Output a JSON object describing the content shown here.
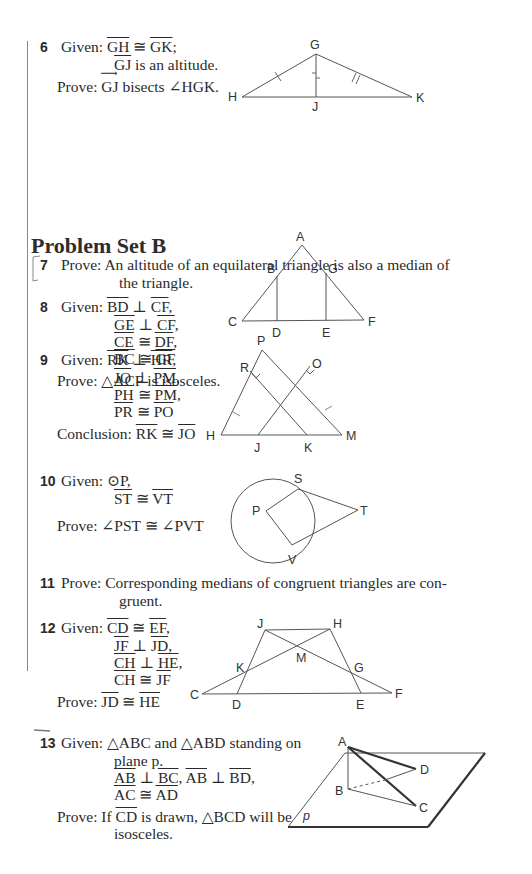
{
  "section_heading": "Problem Set B",
  "problems": [
    {
      "number": "6",
      "given_label": "Given:",
      "given": [
        "GH ≅ GK;",
        "GJ is an altitude."
      ],
      "prove_label": "Prove:",
      "prove": "GJ bisects ∠HGK.",
      "figure": {
        "labels": [
          "G",
          "H",
          "J",
          "K"
        ]
      }
    },
    {
      "number": "7",
      "prove_label": "Prove:",
      "prove_lines": [
        "An altitude of an equilateral triangle is also a median of",
        "the triangle."
      ]
    },
    {
      "number": "8",
      "given_label": "Given:",
      "given": [
        "BD ⊥ CF,",
        "GE ⊥ CF,",
        "CE ≅ DF,",
        "BC ≅ GF"
      ],
      "prove_label": "Prove:",
      "prove": "△ACF is isosceles.",
      "figure": {
        "labels": [
          "A",
          "B",
          "G",
          "C",
          "D",
          "E",
          "F"
        ]
      }
    },
    {
      "number": "9",
      "given_label": "Given:",
      "given": [
        "RK ⊥ HR,",
        "JO ⊥ PM,",
        "PH ≅ PM,",
        "PR ≅ PO"
      ],
      "prove_label": "Conclusion:",
      "prove": "RK ≅ JO",
      "figure": {
        "labels": [
          "P",
          "R",
          "O",
          "H",
          "J",
          "K",
          "M"
        ]
      }
    },
    {
      "number": "10",
      "given_label": "Given:",
      "given": [
        "⊙P,",
        "ST ≅ VT"
      ],
      "prove_label": "Prove:",
      "prove": "∠PST ≅ ∠PVT",
      "figure": {
        "labels": [
          "S",
          "P",
          "T",
          "V"
        ]
      }
    },
    {
      "number": "11",
      "prove_label": "Prove:",
      "prove_lines": [
        "Corresponding medians of congruent triangles are con-",
        "gruent."
      ]
    },
    {
      "number": "12",
      "given_label": "Given:",
      "given": [
        "CD ≅ EF,",
        "JF ⊥ JD,",
        "CH ⊥ HE,",
        "CH ≅ JF"
      ],
      "prove_label": "Prove:",
      "prove": "JD ≅ HE",
      "figure": {
        "labels": [
          "J",
          "H",
          "M",
          "K",
          "G",
          "C",
          "D",
          "E",
          "F"
        ]
      }
    },
    {
      "number": "13",
      "given_label": "Given:",
      "given": [
        "△ABC and △ABD standing on",
        "plane p.",
        "AB ⊥ BC, AB ⊥ BD,",
        "AC ≅ AD"
      ],
      "prove_label": "Prove:",
      "prove_lines": [
        "If CD is drawn, △BCD will be",
        "isosceles."
      ],
      "figure": {
        "labels": [
          "A",
          "D",
          "B",
          "C",
          "p"
        ]
      }
    }
  ]
}
